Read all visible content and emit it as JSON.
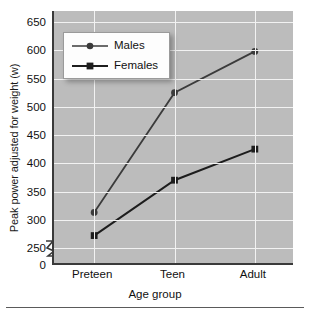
{
  "chart_data": {
    "type": "line",
    "title": "",
    "xlabel": "Age group",
    "ylabel": "Peak power adjusted for weight (w)",
    "categories": [
      "Preteen",
      "Teen",
      "Adult"
    ],
    "series": [
      {
        "name": "Males",
        "marker": "circle",
        "values": [
          313,
          525,
          598
        ]
      },
      {
        "name": "Females",
        "marker": "square",
        "values": [
          272,
          370,
          425
        ]
      }
    ],
    "yticks": [
      0,
      250,
      300,
      350,
      400,
      450,
      500,
      550,
      600,
      650
    ],
    "ylim": [
      250,
      650
    ],
    "y_axis_break": true,
    "grid": "both",
    "legend_position": "top-left",
    "colors": {
      "plot_background": "#bcbcbc",
      "gridline": "#f2f2f2",
      "axis": "#3a3a3a",
      "series_line": "#3b3b3b",
      "legend_background": "#fdfdfd",
      "text": "#111111"
    }
  }
}
